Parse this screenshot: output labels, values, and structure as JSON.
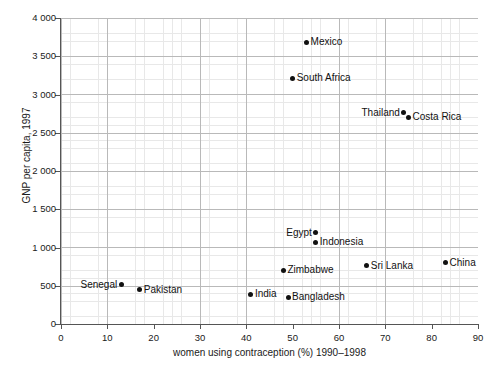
{
  "chart_data": {
    "type": "scatter",
    "title": "",
    "xlabel": "women using contraception (%) 1990–1998",
    "ylabel": "GNP per capita, 1997",
    "xlim": [
      0,
      90
    ],
    "ylim": [
      0,
      4000
    ],
    "xticks": [
      "0",
      "10",
      "20",
      "30",
      "40",
      "50",
      "60",
      "70",
      "80",
      "90"
    ],
    "yticks": [
      "0",
      "500",
      "1 000",
      "1 500",
      "2 000",
      "2 500",
      "3 000",
      "3 500",
      "4 000"
    ],
    "xtick_values": [
      0,
      10,
      20,
      30,
      40,
      50,
      60,
      70,
      80,
      90
    ],
    "ytick_values": [
      0,
      500,
      1000,
      1500,
      2000,
      2500,
      3000,
      3500,
      4000
    ],
    "grid": true,
    "grid_minor_x_step": 2,
    "grid_minor_y_step": 100,
    "grid_major_x_step": 10,
    "grid_major_y_step": 500,
    "legend": "none",
    "marker_color": "#111111",
    "points": [
      {
        "label": "Mexico",
        "x": 53,
        "y": 3680,
        "label_side": "right"
      },
      {
        "label": "South Africa",
        "x": 50,
        "y": 3210,
        "label_side": "right"
      },
      {
        "label": "Thailand",
        "x": 74,
        "y": 2760,
        "label_side": "left"
      },
      {
        "label": "Costa Rica",
        "x": 75,
        "y": 2700,
        "label_side": "right"
      },
      {
        "label": "Egypt",
        "x": 55,
        "y": 1190,
        "label_side": "left"
      },
      {
        "label": "Indonesia",
        "x": 55,
        "y": 1070,
        "label_side": "right"
      },
      {
        "label": "China",
        "x": 83,
        "y": 800,
        "label_side": "right"
      },
      {
        "label": "Sri Lanka",
        "x": 66,
        "y": 760,
        "label_side": "right"
      },
      {
        "label": "Zimbabwe",
        "x": 48,
        "y": 700,
        "label_side": "right"
      },
      {
        "label": "Senegal",
        "x": 13,
        "y": 510,
        "label_side": "left"
      },
      {
        "label": "Pakistan",
        "x": 17,
        "y": 450,
        "label_side": "right"
      },
      {
        "label": "India",
        "x": 41,
        "y": 390,
        "label_side": "right"
      },
      {
        "label": "Bangladesh",
        "x": 49,
        "y": 350,
        "label_side": "right"
      }
    ]
  }
}
